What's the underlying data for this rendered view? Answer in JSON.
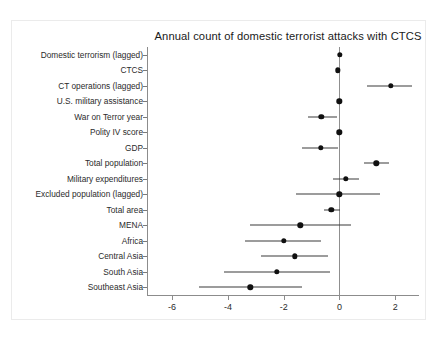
{
  "chart_data": {
    "type": "scatter",
    "subtype": "coefficient-plot-with-confidence-intervals",
    "title": "Annual count of domestic terrorist attacks with CTCS",
    "xlabel": "",
    "ylabel": "",
    "xlim": [
      -6.9,
      2.85
    ],
    "xticks": [
      -6,
      -4,
      -2,
      0,
      2
    ],
    "xticklabels": [
      "-6",
      "-4",
      "-2",
      "0",
      "2"
    ],
    "grid": false,
    "legend": null,
    "reference_line": 0,
    "categories": [
      "Domestic terrorism (lagged)",
      "CTCS",
      "CT operations (lagged)",
      "U.S. military assistance",
      "War on Terror year",
      "Polity IV score",
      "GDP",
      "Total population",
      "Military expenditures",
      "Excluded population (lagged)",
      "Total area",
      "MENA",
      "Africa",
      "Central Asia",
      "South Asia",
      "Southeast Asia"
    ],
    "points": [
      {
        "label": "Domestic terrorism (lagged)",
        "estimate": 0.02,
        "ci_low": 0.0,
        "ci_high": 0.05
      },
      {
        "label": "CTCS",
        "estimate": -0.05,
        "ci_low": -0.12,
        "ci_high": 0.02
      },
      {
        "label": "CT operations (lagged)",
        "estimate": 1.83,
        "ci_low": 1.0,
        "ci_high": 2.6
      },
      {
        "label": "U.S. military assistance",
        "estimate": 0.0,
        "ci_low": -0.1,
        "ci_high": 0.08
      },
      {
        "label": "War on Terror year",
        "estimate": -0.65,
        "ci_low": -1.12,
        "ci_high": -0.1
      },
      {
        "label": "Polity IV score",
        "estimate": 0.0,
        "ci_low": -0.06,
        "ci_high": 0.06
      },
      {
        "label": "GDP",
        "estimate": -0.67,
        "ci_low": -1.35,
        "ci_high": -0.05
      },
      {
        "label": "Total population",
        "estimate": 1.32,
        "ci_low": 0.88,
        "ci_high": 1.76
      },
      {
        "label": "Military expenditures",
        "estimate": 0.22,
        "ci_low": -0.25,
        "ci_high": 0.7
      },
      {
        "label": "Excluded population (lagged)",
        "estimate": 0.0,
        "ci_low": -1.55,
        "ci_high": 1.45
      },
      {
        "label": "Total area",
        "estimate": -0.3,
        "ci_low": -0.55,
        "ci_high": 0.02
      },
      {
        "label": "MENA",
        "estimate": -1.4,
        "ci_low": -3.2,
        "ci_high": 0.4
      },
      {
        "label": "Africa",
        "estimate": -2.0,
        "ci_low": -3.4,
        "ci_high": -0.65
      },
      {
        "label": "Central Asia",
        "estimate": -1.6,
        "ci_low": -2.8,
        "ci_high": -0.4
      },
      {
        "label": "South Asia",
        "estimate": -2.25,
        "ci_low": -4.15,
        "ci_high": -0.35
      },
      {
        "label": "Southeast Asia",
        "estimate": -3.2,
        "ci_low": -5.02,
        "ci_high": -1.36
      }
    ],
    "colors": {
      "point": "#101010",
      "interval": "#3a3a3a",
      "axis": "#8c8c8c",
      "text": "#2b2b2b",
      "background": "#ffffff"
    }
  }
}
